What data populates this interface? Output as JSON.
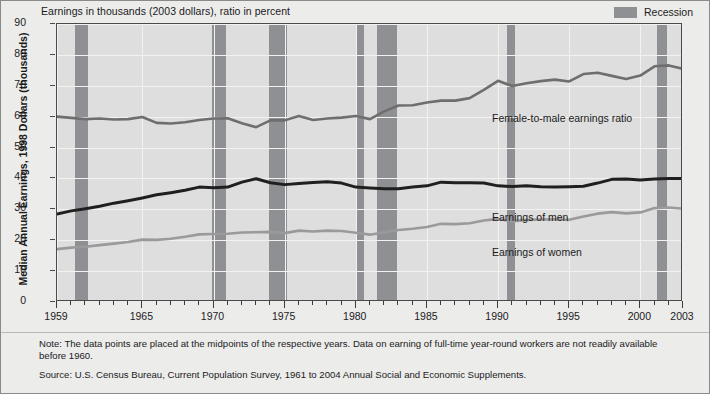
{
  "figure": {
    "units_caption": "Earnings in thousands (2003 dollars), ratio in percent",
    "y_axis_title": "Median Annual Earnings, 1998 Dollars (thousands)",
    "legend": {
      "recession_label": "Recession",
      "recession_color": "#8f9094"
    },
    "notes": [
      "Note: The data points are placed at the midpoints of the respective years. Data on earning of full-time year-round workers are not readily available before 1960.",
      "Source: U.S. Census Bureau, Current Population Survey, 1961 to 2004 Annual Social and Economic Supplements."
    ]
  },
  "chart_data": {
    "type": "line",
    "title": "Earnings in thousands (2003 dollars), ratio in percent",
    "xlabel": "",
    "ylabel": "Median Annual Earnings, 1998 Dollars (thousands)",
    "xlim": [
      1959,
      2003
    ],
    "ylim": [
      0,
      90
    ],
    "yticks": [
      0,
      10,
      20,
      30,
      40,
      50,
      60,
      70,
      80,
      90
    ],
    "xticks": [
      1959,
      1965,
      1970,
      1975,
      1980,
      1985,
      1990,
      1995,
      2000,
      2003
    ],
    "xtick_labels": [
      "1959",
      "1965",
      "1970",
      "1975",
      "1980",
      "1985",
      "1990",
      "1995",
      "2000",
      "2003"
    ],
    "grid": true,
    "legend_position": "in-plot labels",
    "x": [
      1959,
      1960,
      1961,
      1962,
      1963,
      1964,
      1965,
      1966,
      1967,
      1968,
      1969,
      1970,
      1971,
      1972,
      1973,
      1974,
      1975,
      1976,
      1977,
      1978,
      1979,
      1980,
      1981,
      1982,
      1983,
      1984,
      1985,
      1986,
      1987,
      1988,
      1989,
      1990,
      1991,
      1992,
      1993,
      1994,
      1995,
      1996,
      1997,
      1998,
      1999,
      2000,
      2001,
      2002,
      2003
    ],
    "series": [
      {
        "name": "Female-to-male earnings ratio",
        "color": "#6e6e6e",
        "unit": "percent",
        "values": [
          60.0,
          59.6,
          59.2,
          59.4,
          59.1,
          59.2,
          59.9,
          58.0,
          57.8,
          58.2,
          58.9,
          59.4,
          59.5,
          57.9,
          56.6,
          58.8,
          58.8,
          60.2,
          58.9,
          59.4,
          59.7,
          60.2,
          59.2,
          61.7,
          63.6,
          63.7,
          64.6,
          65.2,
          65.2,
          66.0,
          68.7,
          71.6,
          69.9,
          70.8,
          71.5,
          72.0,
          71.4,
          73.8,
          74.2,
          73.2,
          72.2,
          73.3,
          76.3,
          76.6,
          75.5
        ]
      },
      {
        "name": "Earnings of men",
        "color": "#1f1f1f",
        "unit": "thousands of 2003 dollars",
        "values": [
          28.5,
          29.5,
          30.2,
          31.0,
          32.0,
          32.8,
          33.7,
          34.7,
          35.4,
          36.2,
          37.2,
          37.0,
          37.2,
          38.8,
          39.9,
          38.6,
          38.0,
          38.4,
          38.7,
          38.9,
          38.5,
          37.2,
          36.9,
          36.7,
          36.7,
          37.2,
          37.6,
          38.8,
          38.6,
          38.6,
          38.5,
          37.6,
          37.4,
          37.6,
          37.3,
          37.2,
          37.3,
          37.5,
          38.5,
          39.7,
          39.8,
          39.5,
          39.8,
          40.0,
          40.0
        ]
      },
      {
        "name": "Earnings of women",
        "color": "#9a9a9a",
        "unit": "thousands of 2003 dollars",
        "values": [
          17.1,
          17.6,
          17.9,
          18.4,
          18.9,
          19.4,
          20.2,
          20.1,
          20.5,
          21.1,
          21.9,
          22.0,
          22.1,
          22.5,
          22.6,
          22.7,
          22.3,
          23.1,
          22.8,
          23.1,
          23.0,
          22.4,
          21.8,
          22.6,
          23.3,
          23.7,
          24.3,
          25.3,
          25.2,
          25.5,
          26.4,
          26.9,
          26.1,
          26.6,
          26.7,
          26.8,
          26.6,
          27.7,
          28.6,
          29.1,
          28.7,
          29.0,
          30.4,
          30.6,
          30.2
        ]
      }
    ],
    "recessions": [
      {
        "start": 1960.3,
        "end": 1961.2
      },
      {
        "start": 1969.9,
        "end": 1970.9
      },
      {
        "start": 1973.9,
        "end": 1975.2
      },
      {
        "start": 1980.1,
        "end": 1980.6
      },
      {
        "start": 1981.5,
        "end": 1982.9
      },
      {
        "start": 1990.6,
        "end": 1991.2
      },
      {
        "start": 2001.2,
        "end": 2001.9
      }
    ],
    "annotations": [
      {
        "text": "Female-to-male earnings ratio",
        "x": 1990,
        "y": 62
      },
      {
        "text": "Earnings of men",
        "x": 1990,
        "y": 32
      },
      {
        "text": "Earnings of women",
        "x": 1990,
        "y": 21
      }
    ]
  }
}
